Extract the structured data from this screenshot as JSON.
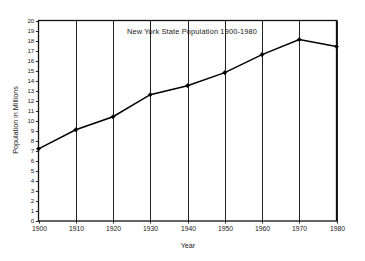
{
  "chart_data": {
    "type": "line",
    "title": "New York State Population   1900-1980",
    "xlabel": "Year",
    "ylabel": "Population in Millions",
    "x": [
      1900,
      1910,
      1920,
      1930,
      1940,
      1950,
      1960,
      1970,
      1980
    ],
    "categories": [
      "1900",
      "1910",
      "1920",
      "1930",
      "1940",
      "1950",
      "1960",
      "1970",
      "1980"
    ],
    "values": [
      7.2,
      9.1,
      10.4,
      12.6,
      13.5,
      14.8,
      16.6,
      18.1,
      17.4
    ],
    "series": [
      {
        "name": "New York State Population",
        "values": [
          7.2,
          9.1,
          10.4,
          12.6,
          13.5,
          14.8,
          16.6,
          18.1,
          17.4
        ]
      }
    ],
    "xlim": [
      1900,
      1980
    ],
    "ylim": [
      0,
      20
    ],
    "ytick_labels": [
      "0",
      "1",
      "2",
      "3",
      "4",
      "5",
      "6",
      "7",
      "8",
      "9",
      "10",
      "11",
      "12",
      "13",
      "14",
      "15",
      "16",
      "17",
      "18",
      "19",
      "20"
    ],
    "ytick_values": [
      0,
      1,
      2,
      3,
      4,
      5,
      6,
      7,
      8,
      9,
      10,
      11,
      12,
      13,
      14,
      15,
      16,
      17,
      18,
      19,
      20
    ],
    "xtick_labels": [
      "1900",
      "1910",
      "1920",
      "1930",
      "1940",
      "1950",
      "1960",
      "1970",
      "1980"
    ],
    "xtick_values": [
      1900,
      1910,
      1920,
      1930,
      1940,
      1950,
      1960,
      1970,
      1980
    ],
    "grid": {
      "vertical": true,
      "horizontal": false
    },
    "legend": {
      "visible": false,
      "position": "none"
    },
    "marker": "diamond",
    "line_color": "#000000",
    "grid_color": "#222222",
    "background_color": "#ffffff",
    "frame_color": "#111111"
  }
}
